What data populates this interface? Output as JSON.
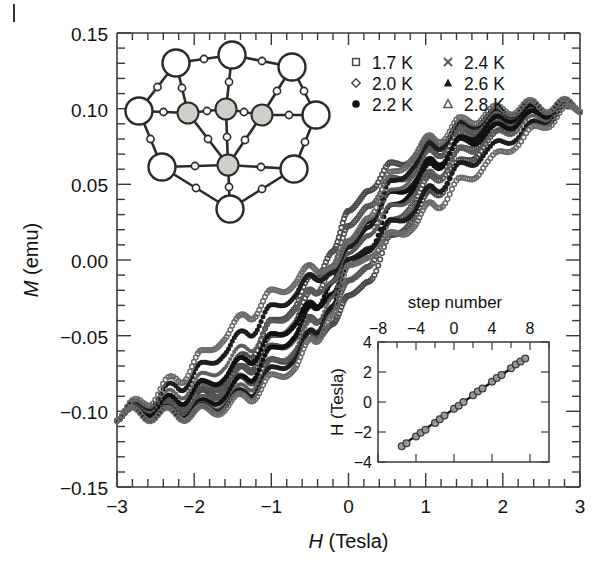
{
  "figure": {
    "kind": "magnetic-hysteresis-figure",
    "corner_mark": "|"
  },
  "main_axes": {
    "xlabel_italic": "H",
    "xlabel_rest": " (Tesla)",
    "ylabel_italic": "M",
    "ylabel_rest": " (emu)",
    "xticks": [
      "−3",
      "−2",
      "−1",
      "0",
      "1",
      "2",
      "3"
    ],
    "yticks": [
      "0.15",
      "0.10",
      "0.05",
      "0.00",
      "−0.05",
      "−0.10",
      "−0.15"
    ],
    "xlim": [
      -3,
      3
    ],
    "ylim": [
      -0.15,
      0.15
    ],
    "xminor_per_interval": 5,
    "yminor_per_interval": 5,
    "grid": false
  },
  "legend": {
    "entries": [
      {
        "label": "1.7 K",
        "marker": "open-square",
        "color": "#4a4a4a",
        "column": 0,
        "row": 0
      },
      {
        "label": "2.0 K",
        "marker": "open-diamond",
        "color": "#4a4a4a",
        "column": 0,
        "row": 1
      },
      {
        "label": "2.2 K",
        "marker": "filled-circle",
        "color": "#111111",
        "column": 0,
        "row": 2
      },
      {
        "label": "2.4 K",
        "marker": "cross-x",
        "color": "#555555",
        "column": 1,
        "row": 0
      },
      {
        "label": "2.6 K",
        "marker": "filled-triangle",
        "color": "#1d1d1d",
        "column": 1,
        "row": 1
      },
      {
        "label": "2.8 K",
        "marker": "open-triangle",
        "color": "#5a5a5a",
        "column": 1,
        "row": 2
      }
    ]
  },
  "inset_plot": {
    "title_top": "step number",
    "ylabel": "H (Tesla)",
    "xticks": [
      "−8",
      "−4",
      "0",
      "4",
      "8"
    ],
    "yticks": [
      "4",
      "2",
      "0",
      "−2",
      "−4"
    ],
    "xlim": [
      -9,
      9
    ],
    "ylim": [
      -4,
      4
    ],
    "fit_line": true
  },
  "molecule_inset": {
    "name": "Mn12-acetate cluster",
    "outer_atom_count": 8,
    "inner_atom_count": 4,
    "outer_color": "#ffffff",
    "inner_color": "#cfcfc8"
  },
  "chart_data": {
    "type": "line",
    "title": "",
    "xlabel": "H (Tesla)",
    "ylabel": "M (emu)",
    "xlim": [
      -3,
      3
    ],
    "ylim": [
      -0.15,
      0.15
    ],
    "grid": false,
    "legend_position": "top-center",
    "saturation_positive": 0.102,
    "saturation_negative": -0.102,
    "step_fields_tesla": [
      -2.8,
      -2.35,
      -1.9,
      -1.45,
      -1.0,
      -0.55,
      0.0,
      0.55,
      1.0,
      1.45,
      1.9,
      2.35,
      2.8
    ],
    "series": [
      {
        "name": "1.7 K",
        "marker": "open-square",
        "color": "#4a4a4a",
        "branch_up": {
          "x": [
            -3.0,
            -2.6,
            -2.2,
            -1.9,
            -1.6,
            -1.3,
            -1.0,
            -0.7,
            -0.45,
            -0.2,
            0.0,
            0.25,
            0.55,
            0.85,
            1.1,
            1.45,
            1.8,
            2.2,
            2.6,
            3.0
          ],
          "y": [
            -0.102,
            -0.1,
            -0.096,
            -0.09,
            -0.085,
            -0.078,
            -0.07,
            -0.06,
            -0.05,
            -0.038,
            -0.028,
            -0.01,
            0.012,
            0.03,
            0.044,
            0.062,
            0.078,
            0.092,
            0.099,
            0.102
          ]
        },
        "branch_down": {
          "x": [
            3.0,
            2.6,
            2.2,
            1.8,
            1.45,
            1.1,
            0.85,
            0.55,
            0.25,
            0.0,
            -0.2,
            -0.45,
            -0.7,
            -1.0,
            -1.3,
            -1.6,
            -1.9,
            -2.2,
            -2.6,
            -3.0
          ],
          "y": [
            0.102,
            0.1,
            0.096,
            0.09,
            0.085,
            0.078,
            0.07,
            0.06,
            0.05,
            0.028,
            0.01,
            -0.012,
            -0.03,
            -0.044,
            -0.062,
            -0.078,
            -0.09,
            -0.096,
            -0.1,
            -0.102
          ]
        }
      },
      {
        "name": "2.0 K",
        "marker": "open-diamond",
        "color": "#555555",
        "branch_up": {
          "x": [
            -3.0,
            -2.6,
            -2.2,
            -1.9,
            -1.6,
            -1.3,
            -1.0,
            -0.7,
            -0.45,
            -0.2,
            0.0,
            0.25,
            0.55,
            0.85,
            1.1,
            1.45,
            1.8,
            2.2,
            2.6,
            3.0
          ],
          "y": [
            -0.102,
            -0.099,
            -0.094,
            -0.087,
            -0.08,
            -0.071,
            -0.061,
            -0.05,
            -0.04,
            -0.028,
            -0.018,
            0.0,
            0.022,
            0.04,
            0.054,
            0.07,
            0.084,
            0.095,
            0.1,
            0.102
          ]
        },
        "branch_down": {
          "x": [
            3.0,
            2.6,
            2.2,
            1.8,
            1.45,
            1.1,
            0.85,
            0.55,
            0.25,
            0.0,
            -0.2,
            -0.45,
            -0.7,
            -1.0,
            -1.3,
            -1.6,
            -1.9,
            -2.2,
            -2.6,
            -3.0
          ],
          "y": [
            0.102,
            0.099,
            0.094,
            0.087,
            0.08,
            0.071,
            0.061,
            0.05,
            0.04,
            0.018,
            0.0,
            -0.022,
            -0.04,
            -0.054,
            -0.07,
            -0.084,
            -0.095,
            -0.1,
            -0.1,
            -0.102
          ]
        }
      },
      {
        "name": "2.2 K",
        "marker": "filled-circle",
        "color": "#111111",
        "branch_up": {
          "x": [
            -3.0,
            -2.6,
            -2.2,
            -1.9,
            -1.6,
            -1.3,
            -1.0,
            -0.7,
            -0.45,
            -0.2,
            0.0,
            0.25,
            0.55,
            0.85,
            1.1,
            1.45,
            1.8,
            2.2,
            2.6,
            3.0
          ],
          "y": [
            -0.102,
            -0.098,
            -0.092,
            -0.084,
            -0.076,
            -0.065,
            -0.053,
            -0.041,
            -0.03,
            -0.018,
            -0.008,
            0.01,
            0.032,
            0.049,
            0.062,
            0.077,
            0.089,
            0.097,
            0.101,
            0.102
          ]
        },
        "branch_down": {
          "x": [
            3.0,
            2.6,
            2.2,
            1.8,
            1.45,
            1.1,
            0.85,
            0.55,
            0.25,
            0.0,
            -0.2,
            -0.45,
            -0.7,
            -1.0,
            -1.3,
            -1.6,
            -1.9,
            -2.2,
            -2.6,
            -3.0
          ],
          "y": [
            0.102,
            0.098,
            0.092,
            0.084,
            0.076,
            0.065,
            0.053,
            0.041,
            0.03,
            0.008,
            -0.01,
            -0.032,
            -0.049,
            -0.062,
            -0.077,
            -0.089,
            -0.097,
            -0.101,
            -0.101,
            -0.102
          ]
        }
      },
      {
        "name": "2.4 K",
        "marker": "cross-x",
        "color": "#5a5a5a",
        "branch_up": {
          "x": [
            -3.0,
            -2.6,
            -2.2,
            -1.9,
            -1.6,
            -1.3,
            -1.0,
            -0.7,
            -0.45,
            -0.2,
            0.0,
            0.25,
            0.55,
            0.85,
            1.1,
            1.45,
            1.8,
            2.2,
            2.6,
            3.0
          ],
          "y": [
            -0.102,
            -0.096,
            -0.088,
            -0.079,
            -0.069,
            -0.057,
            -0.045,
            -0.032,
            -0.021,
            -0.01,
            0.0,
            0.02,
            0.042,
            0.058,
            0.07,
            0.083,
            0.093,
            0.099,
            0.102,
            0.102
          ]
        },
        "branch_down": {
          "x": [
            3.0,
            2.6,
            2.2,
            1.8,
            1.45,
            1.1,
            0.85,
            0.55,
            0.25,
            0.0,
            -0.2,
            -0.45,
            -0.7,
            -1.0,
            -1.3,
            -1.6,
            -1.9,
            -2.2,
            -2.6,
            -3.0
          ],
          "y": [
            0.102,
            0.096,
            0.088,
            0.079,
            0.069,
            0.057,
            0.045,
            0.032,
            0.021,
            0.0,
            -0.02,
            -0.042,
            -0.058,
            -0.07,
            -0.083,
            -0.093,
            -0.099,
            -0.102,
            -0.102,
            -0.102
          ]
        }
      },
      {
        "name": "2.6 K",
        "marker": "filled-triangle",
        "color": "#1d1d1d",
        "branch_up": {
          "x": [
            -3.0,
            -2.6,
            -2.2,
            -1.9,
            -1.6,
            -1.3,
            -1.0,
            -0.7,
            -0.45,
            -0.2,
            0.0,
            0.25,
            0.55,
            0.85,
            1.1,
            1.45,
            1.8,
            2.2,
            2.6,
            3.0
          ],
          "y": [
            -0.102,
            -0.094,
            -0.083,
            -0.072,
            -0.06,
            -0.047,
            -0.034,
            -0.022,
            -0.012,
            -0.004,
            0.004,
            0.026,
            0.048,
            0.064,
            0.075,
            0.087,
            0.095,
            0.1,
            0.102,
            0.102
          ]
        },
        "branch_down": {
          "x": [
            3.0,
            2.6,
            2.2,
            1.8,
            1.45,
            1.1,
            0.85,
            0.55,
            0.25,
            0.0,
            -0.2,
            -0.45,
            -0.7,
            -1.0,
            -1.3,
            -1.6,
            -1.9,
            -2.2,
            -2.6,
            -3.0
          ],
          "y": [
            0.102,
            0.094,
            0.083,
            0.072,
            0.06,
            0.047,
            0.034,
            0.022,
            0.012,
            -0.004,
            -0.026,
            -0.048,
            -0.064,
            -0.075,
            -0.087,
            -0.095,
            -0.1,
            -0.102,
            -0.102,
            -0.102
          ]
        }
      },
      {
        "name": "2.8 K",
        "marker": "open-triangle",
        "color": "#6a6a6a",
        "branch_up": {
          "x": [
            -3.0,
            -2.6,
            -2.2,
            -1.9,
            -1.6,
            -1.3,
            -1.0,
            -0.7,
            -0.45,
            -0.2,
            0.0,
            0.25,
            0.55,
            0.85,
            1.1,
            1.45,
            1.8,
            2.2,
            2.6,
            3.0
          ],
          "y": [
            -0.102,
            -0.092,
            -0.078,
            -0.064,
            -0.05,
            -0.036,
            -0.024,
            -0.014,
            -0.006,
            0.0,
            0.008,
            0.032,
            0.054,
            0.07,
            0.08,
            0.09,
            0.097,
            0.101,
            0.102,
            0.102
          ]
        },
        "branch_down": {
          "x": [
            3.0,
            2.6,
            2.2,
            1.8,
            1.45,
            1.1,
            0.85,
            0.55,
            0.25,
            0.0,
            -0.2,
            -0.45,
            -0.7,
            -1.0,
            -1.3,
            -1.6,
            -1.9,
            -2.2,
            -2.6,
            -3.0
          ],
          "y": [
            0.102,
            0.092,
            0.078,
            0.064,
            0.05,
            0.036,
            0.024,
            0.014,
            0.006,
            -0.008,
            -0.032,
            -0.054,
            -0.07,
            -0.08,
            -0.09,
            -0.097,
            -0.101,
            -0.102,
            -0.102,
            -0.102
          ]
        }
      }
    ]
  },
  "inset_chart_data": {
    "type": "scatter",
    "xlabel": "step number",
    "ylabel": "H (Tesla)",
    "xlim": [
      -9,
      9
    ],
    "ylim": [
      -4,
      4
    ],
    "grid": false,
    "step_numbers": [
      -6.5,
      -6,
      -5,
      -4.5,
      -4,
      -3,
      -2.5,
      -2,
      -1,
      -0.5,
      0,
      1,
      1.5,
      2,
      3,
      3.5,
      4,
      5,
      5.5,
      6,
      6.5
    ],
    "field_values": [
      -2.95,
      -2.75,
      -2.3,
      -2.05,
      -1.85,
      -1.4,
      -1.15,
      -0.9,
      -0.45,
      -0.25,
      0.0,
      0.45,
      0.7,
      0.9,
      1.35,
      1.6,
      1.8,
      2.25,
      2.5,
      2.7,
      2.9
    ],
    "fit_slope_tesla_per_step": 0.45,
    "fit_intercept": 0.0
  }
}
